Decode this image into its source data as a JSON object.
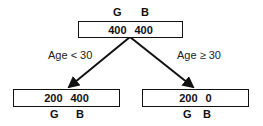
{
  "tree": {
    "root": {
      "header_labels": [
        "G",
        "B"
      ],
      "values": [
        "400",
        "400"
      ]
    },
    "left": {
      "condition": "Age < 30",
      "values": [
        "200",
        "400"
      ],
      "footer_labels": [
        "G",
        "B"
      ]
    },
    "right": {
      "condition": "Age ≥ 30",
      "values": [
        "200",
        "0"
      ],
      "footer_labels": [
        "G",
        "B"
      ]
    }
  }
}
